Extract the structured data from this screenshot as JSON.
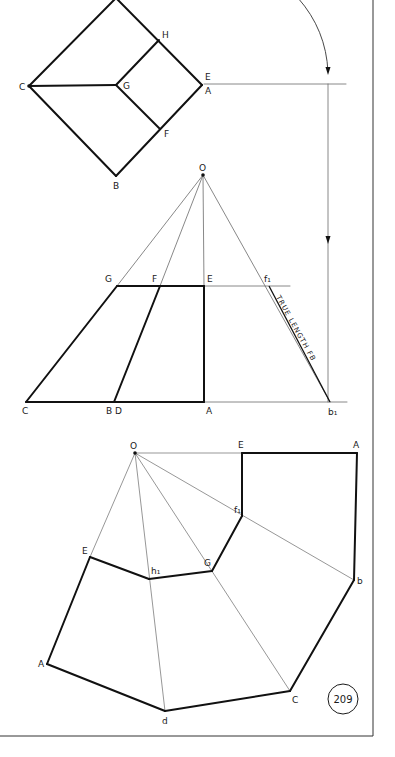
{
  "page": {
    "number": "209",
    "border": {
      "right_x": 373,
      "bottom_y": 736
    },
    "colors": {
      "ink": "#111111",
      "thin": "#6a6a6a",
      "paper": "#ffffff"
    }
  },
  "plan_view": {
    "title": "plan",
    "thick_lines": [
      [
        [
          116,
          -2
        ],
        [
          29,
          86
        ]
      ],
      [
        [
          29,
          86
        ],
        [
          116,
          176
        ]
      ],
      [
        [
          116,
          176
        ],
        [
          202,
          85
        ]
      ],
      [
        [
          202,
          85
        ],
        [
          116,
          -2
        ]
      ],
      [
        [
          29,
          86
        ],
        [
          116,
          85
        ]
      ],
      [
        [
          116,
          85
        ],
        [
          159,
          40
        ]
      ],
      [
        [
          116,
          85
        ],
        [
          160,
          129
        ]
      ]
    ],
    "thin_lines": [
      [
        [
          204,
          84
        ],
        [
          346,
          84
        ]
      ]
    ],
    "labels": [
      {
        "text": "H",
        "x": 162,
        "y": 38
      },
      {
        "text": "C",
        "x": 19,
        "y": 90
      },
      {
        "text": "G",
        "x": 123,
        "y": 89
      },
      {
        "text": "E",
        "x": 205,
        "y": 80
      },
      {
        "text": "A",
        "x": 205,
        "y": 94
      },
      {
        "text": "F",
        "x": 164,
        "y": 137
      },
      {
        "text": "B",
        "x": 113,
        "y": 189
      }
    ]
  },
  "elevation_view": {
    "apex": {
      "label": "O",
      "x": 203,
      "y": 175
    },
    "thick_lines": [
      [
        [
          26,
          402
        ],
        [
          204,
          402
        ]
      ],
      [
        [
          26,
          402
        ],
        [
          117,
          286
        ]
      ],
      [
        [
          117,
          286
        ],
        [
          204,
          286
        ]
      ],
      [
        [
          204,
          286
        ],
        [
          204,
          402
        ]
      ],
      [
        [
          114,
          402
        ],
        [
          160,
          286
        ]
      ]
    ],
    "thin_lines": [
      [
        [
          203,
          175
        ],
        [
          117,
          286
        ]
      ],
      [
        [
          203,
          175
        ],
        [
          160,
          286
        ]
      ],
      [
        [
          203,
          175
        ],
        [
          204,
          286
        ]
      ],
      [
        [
          203,
          175
        ],
        [
          330,
          402
        ]
      ],
      [
        [
          204,
          286
        ],
        [
          290,
          286
        ]
      ],
      [
        [
          204,
          402
        ],
        [
          347,
          402
        ]
      ],
      [
        [
          328,
          84
        ],
        [
          328,
          402
        ]
      ]
    ],
    "labels": [
      {
        "text": "O",
        "x": 199,
        "y": 171
      },
      {
        "text": "G",
        "x": 105,
        "y": 282
      },
      {
        "text": "F",
        "x": 152,
        "y": 282
      },
      {
        "text": "E",
        "x": 207,
        "y": 282
      },
      {
        "text": "f₁",
        "x": 264,
        "y": 282
      },
      {
        "text": "C",
        "x": 22,
        "y": 414
      },
      {
        "text": "B",
        "x": 106,
        "y": 414
      },
      {
        "text": "D",
        "x": 115,
        "y": 414
      },
      {
        "text": "A",
        "x": 206,
        "y": 414
      },
      {
        "text": "b₁",
        "x": 328,
        "y": 415
      }
    ],
    "annotation": {
      "text": "TRUE LENGTH FB",
      "x": 276,
      "y": 297,
      "angle": 61
    },
    "arc": {
      "path": "M298,-2 A 120 120 0 0 1 328 72"
    },
    "arrows": [
      {
        "x": 328,
        "y": 75,
        "dir": "down"
      },
      {
        "x": 328,
        "y": 244,
        "dir": "down"
      }
    ]
  },
  "development_view": {
    "apex": {
      "label": "O",
      "x": 135,
      "y": 453
    },
    "thick_lines": [
      [
        [
          242,
          453
        ],
        [
          357,
          453
        ]
      ],
      [
        [
          357,
          453
        ],
        [
          354,
          580
        ]
      ],
      [
        [
          242,
          453
        ],
        [
          242,
          516
        ]
      ],
      [
        [
          242,
          516
        ],
        [
          212,
          571
        ]
      ],
      [
        [
          212,
          571
        ],
        [
          149,
          579
        ]
      ],
      [
        [
          149,
          579
        ],
        [
          90,
          557
        ]
      ],
      [
        [
          90,
          557
        ],
        [
          47,
          664
        ]
      ],
      [
        [
          47,
          664
        ],
        [
          165,
          711
        ]
      ],
      [
        [
          165,
          711
        ],
        [
          290,
          691
        ]
      ],
      [
        [
          290,
          691
        ],
        [
          354,
          580
        ]
      ]
    ],
    "thin_lines": [
      [
        [
          135,
          453
        ],
        [
          242,
          453
        ]
      ],
      [
        [
          135,
          453
        ],
        [
          90,
          557
        ]
      ],
      [
        [
          135,
          453
        ],
        [
          165,
          711
        ]
      ],
      [
        [
          135,
          453
        ],
        [
          290,
          691
        ]
      ],
      [
        [
          135,
          453
        ],
        [
          354,
          580
        ]
      ]
    ],
    "labels": [
      {
        "text": "O",
        "x": 130,
        "y": 449
      },
      {
        "text": "E",
        "x": 238,
        "y": 448
      },
      {
        "text": "A",
        "x": 353,
        "y": 448
      },
      {
        "text": "f₁",
        "x": 234,
        "y": 513
      },
      {
        "text": "G",
        "x": 204,
        "y": 566
      },
      {
        "text": "h₁",
        "x": 151,
        "y": 574
      },
      {
        "text": "E",
        "x": 82,
        "y": 554
      },
      {
        "text": "b",
        "x": 357,
        "y": 584
      },
      {
        "text": "A",
        "x": 38,
        "y": 667
      },
      {
        "text": "C",
        "x": 292,
        "y": 703
      },
      {
        "text": "d",
        "x": 162,
        "y": 724
      }
    ]
  }
}
